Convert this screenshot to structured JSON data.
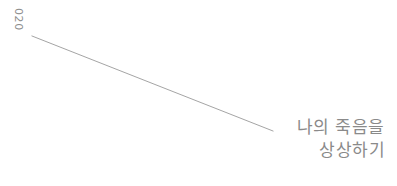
{
  "page": {
    "background_color": "#ffffff",
    "width": 397,
    "height": 186
  },
  "chapter_number": {
    "label": "020",
    "color": "#8e8e8e",
    "orientation": "rotated-90-clockwise"
  },
  "rule": {
    "name": "diagonal-rule",
    "color": "#9a9a9a",
    "x1": 32,
    "y1": 36,
    "x2": 273,
    "y2": 131,
    "stroke_width": 0.9
  },
  "title": {
    "line1": "나의 죽음을",
    "line2": "상상하기",
    "color": "#8a8a8a",
    "alignment": "right"
  }
}
